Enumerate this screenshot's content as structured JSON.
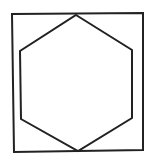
{
  "diagram": {
    "background": "#ffffff",
    "stroke_color": "#222222",
    "stroke_width": 2,
    "shapes": [
      {
        "name": "outer-square",
        "type": "polygon",
        "points": "12,14 143,13 143,150 14,152"
      },
      {
        "name": "inscribed-hexagon",
        "type": "polygon",
        "points": "76,15 132,50 132,118 78,151 21,119 20,51"
      }
    ]
  }
}
